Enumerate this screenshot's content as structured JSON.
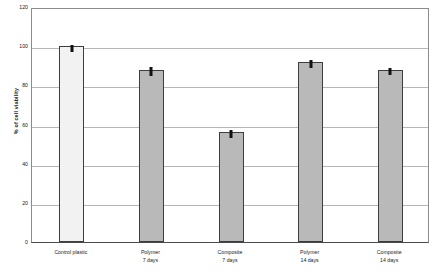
{
  "chart_data": {
    "type": "bar",
    "title": "",
    "xlabel": "",
    "ylabel": "% of cell viability",
    "categories": [
      "Control plastic",
      "Polymer\n7 days",
      "Composite\n7 days",
      "Polymer\n14 days",
      "Composite\n14 days"
    ],
    "category_lines": [
      [
        "Control plastic",
        ""
      ],
      [
        "Polymer",
        "7 days"
      ],
      [
        "Composite",
        "7 days"
      ],
      [
        "Polymer",
        "14 days"
      ],
      [
        "Composite",
        "14 days"
      ]
    ],
    "values": [
      100,
      88,
      56,
      92,
      88
    ],
    "errors": [
      0.8,
      1.2,
      1.0,
      1.0,
      0.8
    ],
    "ylim": [
      0,
      120
    ],
    "ytick_labels": [
      "0",
      "20",
      "40",
      "60",
      "80",
      "100",
      "120"
    ],
    "ytick_values": [
      0,
      20,
      40,
      60,
      80,
      100,
      120
    ],
    "grid": true,
    "legend": "none",
    "bar_colors": [
      "#f2f2f2",
      "#b9b9b9",
      "#b9b9b9",
      "#b9b9b9",
      "#b9b9b9"
    ],
    "bar_border_color": "#3d3d3d",
    "error_bar_color": "#121212"
  }
}
